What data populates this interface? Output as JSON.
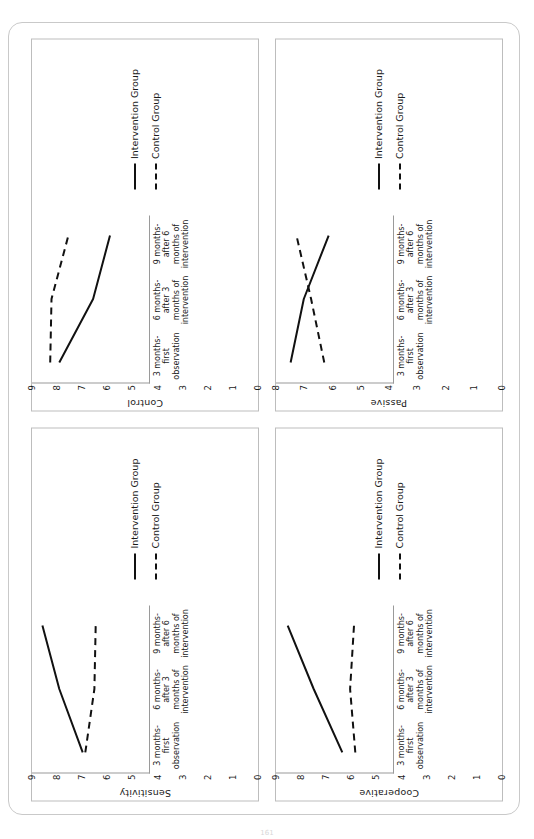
{
  "page": {
    "page_number": "161",
    "background_color": "#ffffff",
    "border_color": "#c9c9c9"
  },
  "legend": {
    "intervention_label": "Intervention Group",
    "control_label": "Control Group",
    "intervention_style": "solid",
    "control_style": "dashed",
    "line_color": "#111111"
  },
  "x_labels_standard": [
    "3 months-\nfirst\nobservation",
    "6 months-\nafter 3\nmonths of\nintervention",
    "9 months-\nafter 6\nmonths of\nintervention"
  ],
  "x_labels_passive": [
    "3 months-first\nobservation",
    "6 months-\nafter 3\nmonths of\nintervention",
    "9 months-\nafter 6\nmonths of\nintervention"
  ],
  "chart_data": [
    {
      "id": "sensitivity",
      "position": "top-left-of-document",
      "type": "line",
      "title": "",
      "ylabel": "Sensitivity",
      "xlabel": "",
      "ylim": [
        0,
        9
      ],
      "yticks": [
        0,
        1,
        2,
        3,
        4,
        5,
        6,
        7,
        8,
        9
      ],
      "grid": false,
      "legend_position": "right",
      "categories": [
        "3 months-first observation",
        "6 months-after 3 months of intervention",
        "9 months-after 6 months of intervention"
      ],
      "series": [
        {
          "name": "Intervention Group",
          "style": "solid",
          "values": [
            5.1,
            6.9,
            8.2
          ]
        },
        {
          "name": "Control Group",
          "style": "dashed",
          "values": [
            4.9,
            4.2,
            4.1
          ]
        }
      ]
    },
    {
      "id": "control",
      "position": "top-right-of-document",
      "type": "line",
      "title": "",
      "ylabel": "Control",
      "xlabel": "",
      "ylim": [
        0,
        9
      ],
      "yticks": [
        0,
        1,
        2,
        3,
        4,
        5,
        6,
        7,
        8,
        9
      ],
      "grid": false,
      "legend_position": "right",
      "categories": [
        "3 months-first observation",
        "6 months-after 3 months of intervention",
        "9 months-after 6 months of intervention"
      ],
      "series": [
        {
          "name": "Intervention Group",
          "style": "solid",
          "values": [
            6.9,
            4.3,
            3.0
          ]
        },
        {
          "name": "Control Group",
          "style": "dashed",
          "values": [
            7.6,
            7.5,
            6.2
          ]
        }
      ]
    },
    {
      "id": "cooperative",
      "position": "bottom-left-of-document",
      "type": "line",
      "title": "",
      "ylabel": "Cooperative",
      "xlabel": "",
      "ylim": [
        0,
        9
      ],
      "yticks": [
        0,
        1,
        2,
        3,
        4,
        5,
        6,
        7,
        8,
        9
      ],
      "grid": false,
      "legend_position": "right",
      "categories": [
        "3 months-first observation",
        "6 months-after 3 months of intervention",
        "9 months-after 6 months of intervention"
      ],
      "series": [
        {
          "name": "Intervention Group",
          "style": "solid",
          "values": [
            3.9,
            6.1,
            8.1
          ]
        },
        {
          "name": "Control Group",
          "style": "dashed",
          "values": [
            2.9,
            3.3,
            3.0
          ]
        }
      ]
    },
    {
      "id": "passive",
      "position": "bottom-right-of-document",
      "type": "line",
      "title": "",
      "ylabel": "Passive",
      "xlabel": "",
      "ylim": [
        0,
        8
      ],
      "yticks": [
        0,
        1,
        2,
        3,
        4,
        5,
        6,
        7,
        8
      ],
      "grid": false,
      "legend_position": "right",
      "categories": [
        "3 months-first observation",
        "6 months-after 3 months of intervention",
        "9 months-after 6 months of intervention"
      ],
      "series": [
        {
          "name": "Intervention Group",
          "style": "solid",
          "values": [
            7.0,
            6.1,
            4.4
          ]
        },
        {
          "name": "Control Group",
          "style": "dashed",
          "values": [
            4.7,
            5.6,
            6.6
          ]
        }
      ]
    }
  ]
}
